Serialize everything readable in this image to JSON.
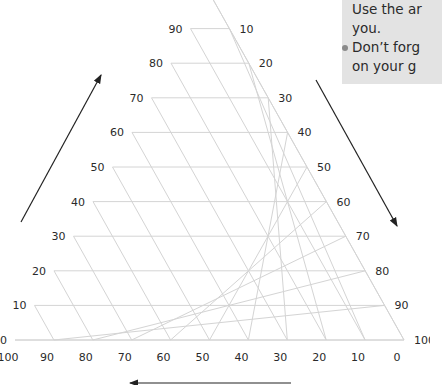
{
  "diagram": {
    "type": "ternary-grid",
    "grid_step": 10,
    "left_axis_labels": [
      "0",
      "10",
      "20",
      "30",
      "40",
      "50",
      "60",
      "70",
      "80",
      "90"
    ],
    "right_axis_labels": [
      "10",
      "20",
      "30",
      "40",
      "50",
      "60",
      "70",
      "80",
      "90",
      "100"
    ],
    "bottom_axis_labels": [
      "100",
      "90",
      "80",
      "70",
      "60",
      "50",
      "40",
      "30",
      "20",
      "10",
      "0"
    ],
    "arrows": [
      {
        "name": "left-axis-arrow",
        "direction": "up-right"
      },
      {
        "name": "right-axis-arrow",
        "direction": "down-right"
      },
      {
        "name": "bottom-axis-arrow",
        "direction": "left"
      }
    ],
    "colors": {
      "grid": "#d4d4d4",
      "labels": "#2a2a2a",
      "arrows": "#222222",
      "callout_bg": "#e3e3e3"
    }
  },
  "callout": {
    "line1": "Use the ar",
    "line2": "you.",
    "line3": "Don’t forg",
    "line4": "on your g"
  }
}
